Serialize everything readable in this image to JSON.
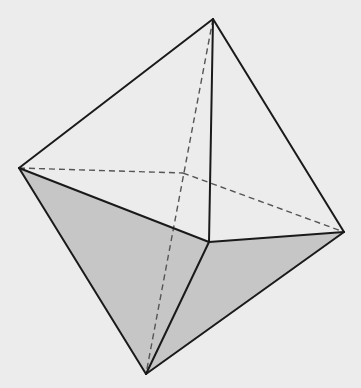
{
  "figure": {
    "vertices": {
      "top": "top apex",
      "left": "left vertex",
      "right": "right vertex",
      "front": "front vertex",
      "back": "back vertex (hidden)",
      "bottom": "bottom apex"
    },
    "visible_edges": [
      [
        "top",
        "left"
      ],
      [
        "top",
        "right"
      ],
      [
        "top",
        "front"
      ],
      [
        "left",
        "front"
      ],
      [
        "front",
        "right"
      ],
      [
        "left",
        "bottom"
      ],
      [
        "front",
        "bottom"
      ],
      [
        "right",
        "bottom"
      ]
    ],
    "hidden_edges": [
      [
        "top",
        "bottom"
      ],
      [
        "left",
        "back"
      ],
      [
        "back",
        "right"
      ]
    ],
    "shaded_faces": [
      [
        "left",
        "front",
        "bottom"
      ],
      [
        "front",
        "right",
        "bottom"
      ]
    ],
    "colors": {
      "background": "#ececec",
      "shade": "#c6c6c6",
      "edge": "#1a1a1a",
      "hidden_edge": "#555555"
    }
  }
}
